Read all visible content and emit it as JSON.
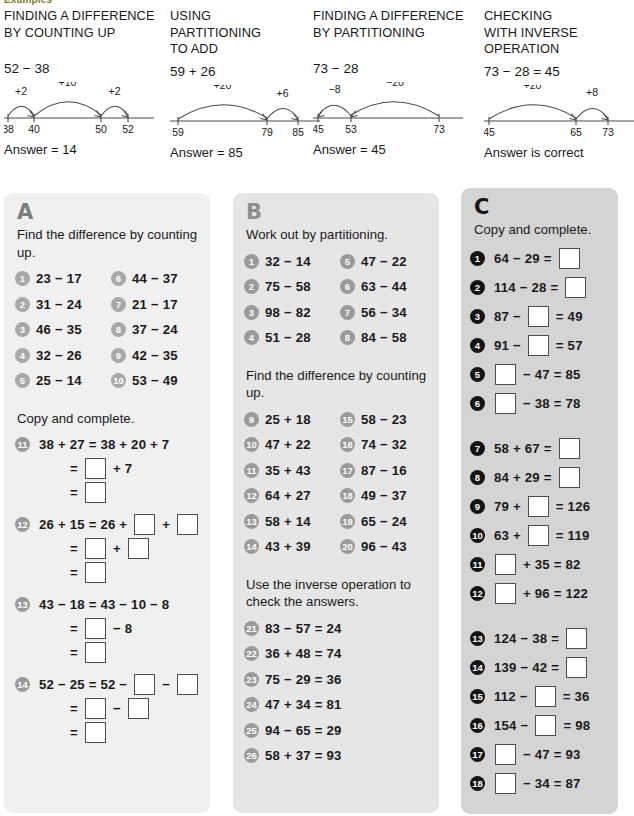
{
  "examples": {
    "caption": "Examples",
    "items": [
      {
        "title": "FINDING A DIFFERENCE\nBY COUNTING UP",
        "sum": "52 − 38",
        "answer": "Answer = 14",
        "numberline": {
          "ticks": [
            {
              "label": "38",
              "x": 4
            },
            {
              "label": "40",
              "x": 30
            },
            {
              "label": "50",
              "x": 97
            },
            {
              "label": "52",
              "x": 124
            }
          ],
          "jumps": [
            {
              "label": "+2",
              "from": 4,
              "to": 30,
              "dir": "right"
            },
            {
              "label": "+10",
              "from": 30,
              "to": 97,
              "dir": "right"
            },
            {
              "label": "+2",
              "from": 97,
              "to": 124,
              "dir": "right"
            }
          ]
        }
      },
      {
        "title": "USING\nPARTITIONING\nTO ADD",
        "sum": "59 + 26",
        "answer": "Answer = 85",
        "numberline": {
          "ticks": [
            {
              "label": "59",
              "x": 8
            },
            {
              "label": "79",
              "x": 97
            },
            {
              "label": "85",
              "x": 128
            }
          ],
          "jumps": [
            {
              "label": "+20",
              "from": 8,
              "to": 97,
              "dir": "right"
            },
            {
              "label": "+6",
              "from": 97,
              "to": 128,
              "dir": "right"
            }
          ]
        }
      },
      {
        "title": "FINDING A DIFFERENCE\nBY PARTITIONING",
        "sum": "73 − 28",
        "answer": "Answer = 45",
        "numberline": {
          "ticks": [
            {
              "label": "45",
              "x": 5
            },
            {
              "label": "53",
              "x": 38
            },
            {
              "label": "73",
              "x": 126
            }
          ],
          "jumps": [
            {
              "label": "−8",
              "from": 38,
              "to": 5,
              "dir": "left"
            },
            {
              "label": "−20",
              "from": 126,
              "to": 38,
              "dir": "left"
            }
          ]
        }
      },
      {
        "title": "CHECKING\nWITH INVERSE\nOPERATION",
        "sum": "73 − 28 = 45",
        "answer": "Answer is correct",
        "numberline": {
          "ticks": [
            {
              "label": "45",
              "x": 5
            },
            {
              "label": "65",
              "x": 92
            },
            {
              "label": "73",
              "x": 124
            }
          ],
          "jumps": [
            {
              "label": "+20",
              "from": 5,
              "to": 92,
              "dir": "right"
            },
            {
              "label": "+8",
              "from": 92,
              "to": 124,
              "dir": "right"
            }
          ]
        }
      }
    ]
  },
  "panel_a": {
    "letter": "A",
    "instruction_1": "Find the difference by counting up.",
    "questions": [
      {
        "n": "1",
        "text": "23 − 17"
      },
      {
        "n": "2",
        "text": "31 − 24"
      },
      {
        "n": "3",
        "text": "46 − 35"
      },
      {
        "n": "4",
        "text": "32 − 26"
      },
      {
        "n": "5",
        "text": "25 − 14"
      },
      {
        "n": "6",
        "text": "44 − 37"
      },
      {
        "n": "7",
        "text": "21 − 17"
      },
      {
        "n": "8",
        "text": "37 − 24"
      },
      {
        "n": "9",
        "text": "42 − 35"
      },
      {
        "n": "10",
        "text": "53 − 49"
      }
    ],
    "instruction_2": "Copy and complete.",
    "blocks": [
      {
        "n": "11",
        "lines": [
          {
            "parts": [
              {
                "t": "text",
                "v": "38 + 27 = 38 + 20 + 7"
              }
            ]
          },
          {
            "parts": [
              {
                "t": "text",
                "v": "="
              },
              {
                "t": "box"
              },
              {
                "t": "text",
                "v": "+ 7"
              }
            ]
          },
          {
            "parts": [
              {
                "t": "text",
                "v": "="
              },
              {
                "t": "box"
              }
            ]
          }
        ]
      },
      {
        "n": "12",
        "lines": [
          {
            "parts": [
              {
                "t": "text",
                "v": "26 + 15 = 26 +"
              },
              {
                "t": "box"
              },
              {
                "t": "text",
                "v": "+"
              },
              {
                "t": "box"
              }
            ]
          },
          {
            "parts": [
              {
                "t": "text",
                "v": "="
              },
              {
                "t": "box"
              },
              {
                "t": "text",
                "v": "+"
              },
              {
                "t": "box"
              }
            ]
          },
          {
            "parts": [
              {
                "t": "text",
                "v": "="
              },
              {
                "t": "box"
              }
            ]
          }
        ]
      },
      {
        "n": "13",
        "lines": [
          {
            "parts": [
              {
                "t": "text",
                "v": "43 − 18 = 43 − 10 − 8"
              }
            ]
          },
          {
            "parts": [
              {
                "t": "text",
                "v": "="
              },
              {
                "t": "box"
              },
              {
                "t": "text",
                "v": "− 8"
              }
            ]
          },
          {
            "parts": [
              {
                "t": "text",
                "v": "="
              },
              {
                "t": "box"
              }
            ]
          }
        ]
      },
      {
        "n": "14",
        "lines": [
          {
            "parts": [
              {
                "t": "text",
                "v": "52 − 25 = 52 −"
              },
              {
                "t": "box"
              },
              {
                "t": "text",
                "v": "−"
              },
              {
                "t": "box"
              }
            ]
          },
          {
            "parts": [
              {
                "t": "text",
                "v": "="
              },
              {
                "t": "box"
              },
              {
                "t": "text",
                "v": "−"
              },
              {
                "t": "box"
              }
            ]
          },
          {
            "parts": [
              {
                "t": "text",
                "v": "="
              },
              {
                "t": "box"
              }
            ]
          }
        ]
      }
    ]
  },
  "panel_b": {
    "letter": "B",
    "instruction_1": "Work out by partitioning.",
    "questions_1": [
      {
        "n": "1",
        "text": "32 − 14"
      },
      {
        "n": "2",
        "text": "75 − 58"
      },
      {
        "n": "3",
        "text": "98 − 82"
      },
      {
        "n": "4",
        "text": "51 − 28"
      },
      {
        "n": "5",
        "text": "47 − 22"
      },
      {
        "n": "6",
        "text": "63 − 44"
      },
      {
        "n": "7",
        "text": "56 − 34"
      },
      {
        "n": "8",
        "text": "84 − 58"
      }
    ],
    "instruction_2": "Find the difference by counting up.",
    "questions_2": [
      {
        "n": "9",
        "text": "25 + 18"
      },
      {
        "n": "10",
        "text": "47 + 22"
      },
      {
        "n": "11",
        "text": "35 + 43"
      },
      {
        "n": "12",
        "text": "64 + 27"
      },
      {
        "n": "13",
        "text": "58 + 14"
      },
      {
        "n": "14",
        "text": "43 + 39"
      },
      {
        "n": "15",
        "text": "58 − 23"
      },
      {
        "n": "16",
        "text": "74 − 32"
      },
      {
        "n": "17",
        "text": "87 − 16"
      },
      {
        "n": "18",
        "text": "49 − 37"
      },
      {
        "n": "19",
        "text": "65 − 24"
      },
      {
        "n": "20",
        "text": "96 − 43"
      }
    ],
    "instruction_3": "Use the inverse operation to check the answers.",
    "questions_3": [
      {
        "n": "21",
        "text": "83 − 57 = 24"
      },
      {
        "n": "22",
        "text": "36 + 48 = 74"
      },
      {
        "n": "23",
        "text": "75 − 29 = 36"
      },
      {
        "n": "24",
        "text": "47 + 34 = 81"
      },
      {
        "n": "25",
        "text": "94 − 65 = 29"
      },
      {
        "n": "26",
        "text": "58 + 37 = 93"
      }
    ]
  },
  "panel_c": {
    "letter": "C",
    "instruction": "Copy and complete.",
    "group_1": [
      {
        "n": "1",
        "parts": [
          {
            "t": "text",
            "v": "64 − 29 ="
          },
          {
            "t": "box"
          }
        ]
      },
      {
        "n": "2",
        "parts": [
          {
            "t": "text",
            "v": "114 − 28 ="
          },
          {
            "t": "box"
          }
        ]
      },
      {
        "n": "3",
        "parts": [
          {
            "t": "text",
            "v": "87 −"
          },
          {
            "t": "box"
          },
          {
            "t": "text",
            "v": "= 49"
          }
        ]
      },
      {
        "n": "4",
        "parts": [
          {
            "t": "text",
            "v": "91 −"
          },
          {
            "t": "box"
          },
          {
            "t": "text",
            "v": "= 57"
          }
        ]
      },
      {
        "n": "5",
        "parts": [
          {
            "t": "box"
          },
          {
            "t": "text",
            "v": "− 47 = 85"
          }
        ]
      },
      {
        "n": "6",
        "parts": [
          {
            "t": "box"
          },
          {
            "t": "text",
            "v": "− 38 = 78"
          }
        ]
      }
    ],
    "group_2": [
      {
        "n": "7",
        "parts": [
          {
            "t": "text",
            "v": "58 + 67 ="
          },
          {
            "t": "box"
          }
        ]
      },
      {
        "n": "8",
        "parts": [
          {
            "t": "text",
            "v": "84 + 29 ="
          },
          {
            "t": "box"
          }
        ]
      },
      {
        "n": "9",
        "parts": [
          {
            "t": "text",
            "v": "79 +"
          },
          {
            "t": "box"
          },
          {
            "t": "text",
            "v": "= 126"
          }
        ]
      },
      {
        "n": "10",
        "parts": [
          {
            "t": "text",
            "v": "63 +"
          },
          {
            "t": "box"
          },
          {
            "t": "text",
            "v": "= 119"
          }
        ]
      },
      {
        "n": "11",
        "parts": [
          {
            "t": "box"
          },
          {
            "t": "text",
            "v": "+ 35 = 82"
          }
        ]
      },
      {
        "n": "12",
        "parts": [
          {
            "t": "box"
          },
          {
            "t": "text",
            "v": "+ 96 = 122"
          }
        ]
      }
    ],
    "group_3": [
      {
        "n": "13",
        "parts": [
          {
            "t": "text",
            "v": "124 − 38 ="
          },
          {
            "t": "box"
          }
        ]
      },
      {
        "n": "14",
        "parts": [
          {
            "t": "text",
            "v": "139 − 42 ="
          },
          {
            "t": "box"
          }
        ]
      },
      {
        "n": "15",
        "parts": [
          {
            "t": "text",
            "v": "112 −"
          },
          {
            "t": "box"
          },
          {
            "t": "text",
            "v": "= 36"
          }
        ]
      },
      {
        "n": "16",
        "parts": [
          {
            "t": "text",
            "v": "154 −"
          },
          {
            "t": "box"
          },
          {
            "t": "text",
            "v": "= 98"
          }
        ]
      },
      {
        "n": "17",
        "parts": [
          {
            "t": "box"
          },
          {
            "t": "text",
            "v": "− 47 = 93"
          }
        ]
      },
      {
        "n": "18",
        "parts": [
          {
            "t": "box"
          },
          {
            "t": "text",
            "v": "− 34 = 87"
          }
        ]
      }
    ]
  },
  "colors": {
    "panel_a_bg": "#f0f0f0",
    "panel_b_bg": "#e6e6e6",
    "panel_c_bg": "#d4d4d4",
    "bullet_light": "#a8a8a8",
    "bullet_dark": "#141414",
    "box_border": "#4d4d4d",
    "text": "#1a1a1a"
  }
}
